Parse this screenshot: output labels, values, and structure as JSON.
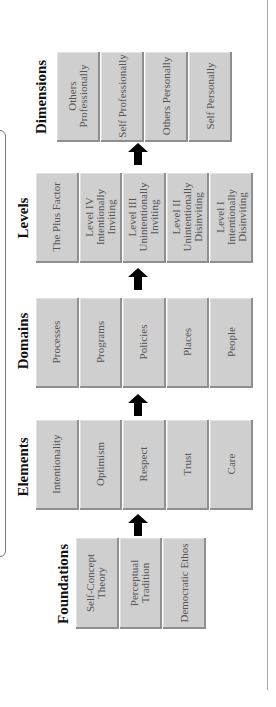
{
  "orientation": "rotated-90-ccw",
  "colors": {
    "box_fill": "#cfcfcf",
    "box_shadow": "#8f8f8f",
    "box_text": "#555555",
    "title_text": "#111111",
    "arrow": "#000000",
    "frame": "#7a7a7a"
  },
  "sections": {
    "dimensions": {
      "title": "Dimensions",
      "items": [
        "Others Professionally",
        "Self Professionally",
        "Others Personally",
        "Self Personally"
      ]
    },
    "levels": {
      "title": "Levels",
      "items": [
        "The Plus Factor",
        "Level IV Intentionally Inviting",
        "Level III Unintentionally Inviting",
        "Level II Unintentionally Disinviting",
        "Level I Intentionally Disinviting"
      ]
    },
    "domains": {
      "title": "Domains",
      "items": [
        "Processes",
        "Programs",
        "Policies",
        "Places",
        "People"
      ]
    },
    "elements": {
      "title": "Elements",
      "items": [
        "Intentionality",
        "Optimism",
        "Respect",
        "Trust",
        "Care"
      ]
    },
    "foundations": {
      "title": "Foundations",
      "items": [
        "Self-Concept Theory",
        "Perceptual Tradition",
        "Democratic Ethos"
      ]
    }
  },
  "arrows": [
    "foundations-to-elements",
    "elements-to-domains",
    "domains-to-levels",
    "levels-to-dimensions"
  ]
}
